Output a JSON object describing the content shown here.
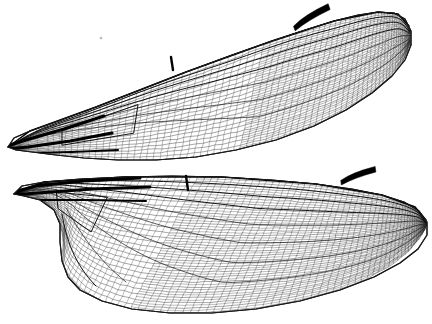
{
  "figure": {
    "style": "black-and-white line drawing",
    "background_color": "#ffffff",
    "ink_color": "#000000",
    "width_px": 432,
    "height_px": 324
  },
  "colors": {
    "background": "#ffffff",
    "outline": "#1a1a1a",
    "vein_major": "#111111",
    "vein_minor": "#2b2b2b",
    "pterostigma": "#000000",
    "base_vein": "#000000"
  },
  "wings": [
    {
      "id": "forewing",
      "label": "Forewing",
      "position": "upper",
      "orientation_deg": -22,
      "base_point": [
        8,
        148
      ],
      "tip_point": [
        412,
        52
      ],
      "outline": "M 8,147 L 14,138 L 30,131 L 58,121 L 96,107 L 140,90 L 186,72 L 232,55 L 272,41 L 305,30 L 334,21 L 358,15 L 378,12 L 394,13 L 405,19 L 411,31 L 411,45 L 405,60 L 392,76 L 372,93 L 346,110 L 314,126 L 276,140 L 236,150 L 196,157 L 156,160 L 118,160 L 84,158 L 56,155 L 32,152 L 16,150 Z",
      "costal_margin": "M 8,147 L 30,131 L 96,107 L 186,72 L 272,41 L 334,21 L 378,12 L 398,14 L 409,26",
      "pterostigma": {
        "x": 291,
        "y": 10,
        "w": 40,
        "h": 11,
        "rot": -19,
        "label": "pterostigma"
      },
      "nodus": {
        "x": 171,
        "y": 66,
        "label": "nodus"
      },
      "longitudinal_veins": 9,
      "crossvein_density": "dense",
      "cell_count_estimate": 820
    },
    {
      "id": "hindwing",
      "label": "Hindwing",
      "position": "lower",
      "orientation_deg": -13,
      "base_point": [
        14,
        196
      ],
      "tip_point": [
        429,
        216
      ],
      "outline": "M 14,194 L 22,186 L 44,182 L 80,179 L 124,177 L 172,176 L 222,177 L 272,180 L 316,184 L 352,189 L 382,195 L 404,202 L 419,211 L 427,222 L 427,235 L 418,249 L 400,263 L 374,277 L 340,290 L 300,301 L 256,309 L 212,313 L 170,313 L 132,309 L 102,301 L 80,290 L 68,277 L 62,261 L 60,242 L 60,224 L 54,210 L 40,200 L 24,196 Z",
      "costal_margin": "M 14,194 L 44,182 L 124,177 L 222,177 L 316,184 L 382,195 L 415,207 L 426,220",
      "pterostigma": {
        "x": 340,
        "y": 169,
        "w": 36,
        "h": 10,
        "rot": -8,
        "label": "pterostigma"
      },
      "nodus": {
        "x": 186,
        "y": 182,
        "label": "nodus"
      },
      "anal_loop": {
        "cx": 108,
        "cy": 258,
        "label": "anal loop"
      },
      "longitudinal_veins": 10,
      "crossvein_density": "very dense",
      "cell_count_estimate": 1150
    }
  ],
  "features": [
    {
      "name": "pterostigma",
      "count": 2,
      "description": "dark thickened cell near leading edge, distal"
    },
    {
      "name": "nodus",
      "count": 2,
      "description": "thickened notch at mid leading edge"
    },
    {
      "name": "wing-base",
      "count": 2,
      "description": "heavy converging veins at proximal end"
    },
    {
      "name": "anal-loop",
      "count": 1,
      "description": "expanded anal field of hindwing"
    },
    {
      "name": "costal-margin",
      "count": 2,
      "description": "reinforced leading edge"
    }
  ],
  "artifact": {
    "x": 101,
    "y": 38,
    "r": 1.3,
    "label": "scan-speck"
  }
}
